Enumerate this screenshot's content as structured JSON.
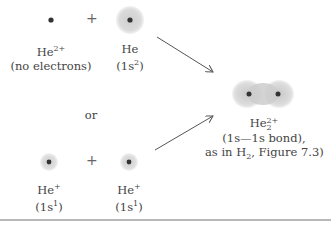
{
  "top_row": {
    "left": {
      "symbol": "He",
      "charge": "2+",
      "note": "(no electrons)"
    },
    "plus": "+",
    "right": {
      "symbol": "He",
      "note_main": "(1s",
      "note_sup": "2",
      "note_end": ")"
    }
  },
  "connector": "or",
  "bottom_row": {
    "left": {
      "symbol": "He",
      "charge": "+",
      "note_main": "(1s",
      "note_sup": "1",
      "note_end": ")"
    },
    "plus": "+",
    "right": {
      "symbol": "He",
      "charge": "+",
      "note_main": "(1s",
      "note_sup": "1",
      "note_end": ")"
    }
  },
  "product": {
    "symbol": "He",
    "subscript": "2",
    "charge": "2+",
    "line1": "(1s—1s bond),",
    "line2_prefix": "as in H",
    "line2_sub": "2",
    "line2_suffix": ", Figure 7.3)"
  },
  "colors": {
    "nucleus": "#333333",
    "cloud": "#d6d6d6",
    "arrow": "#555555",
    "rule": "#b8b8b8"
  }
}
